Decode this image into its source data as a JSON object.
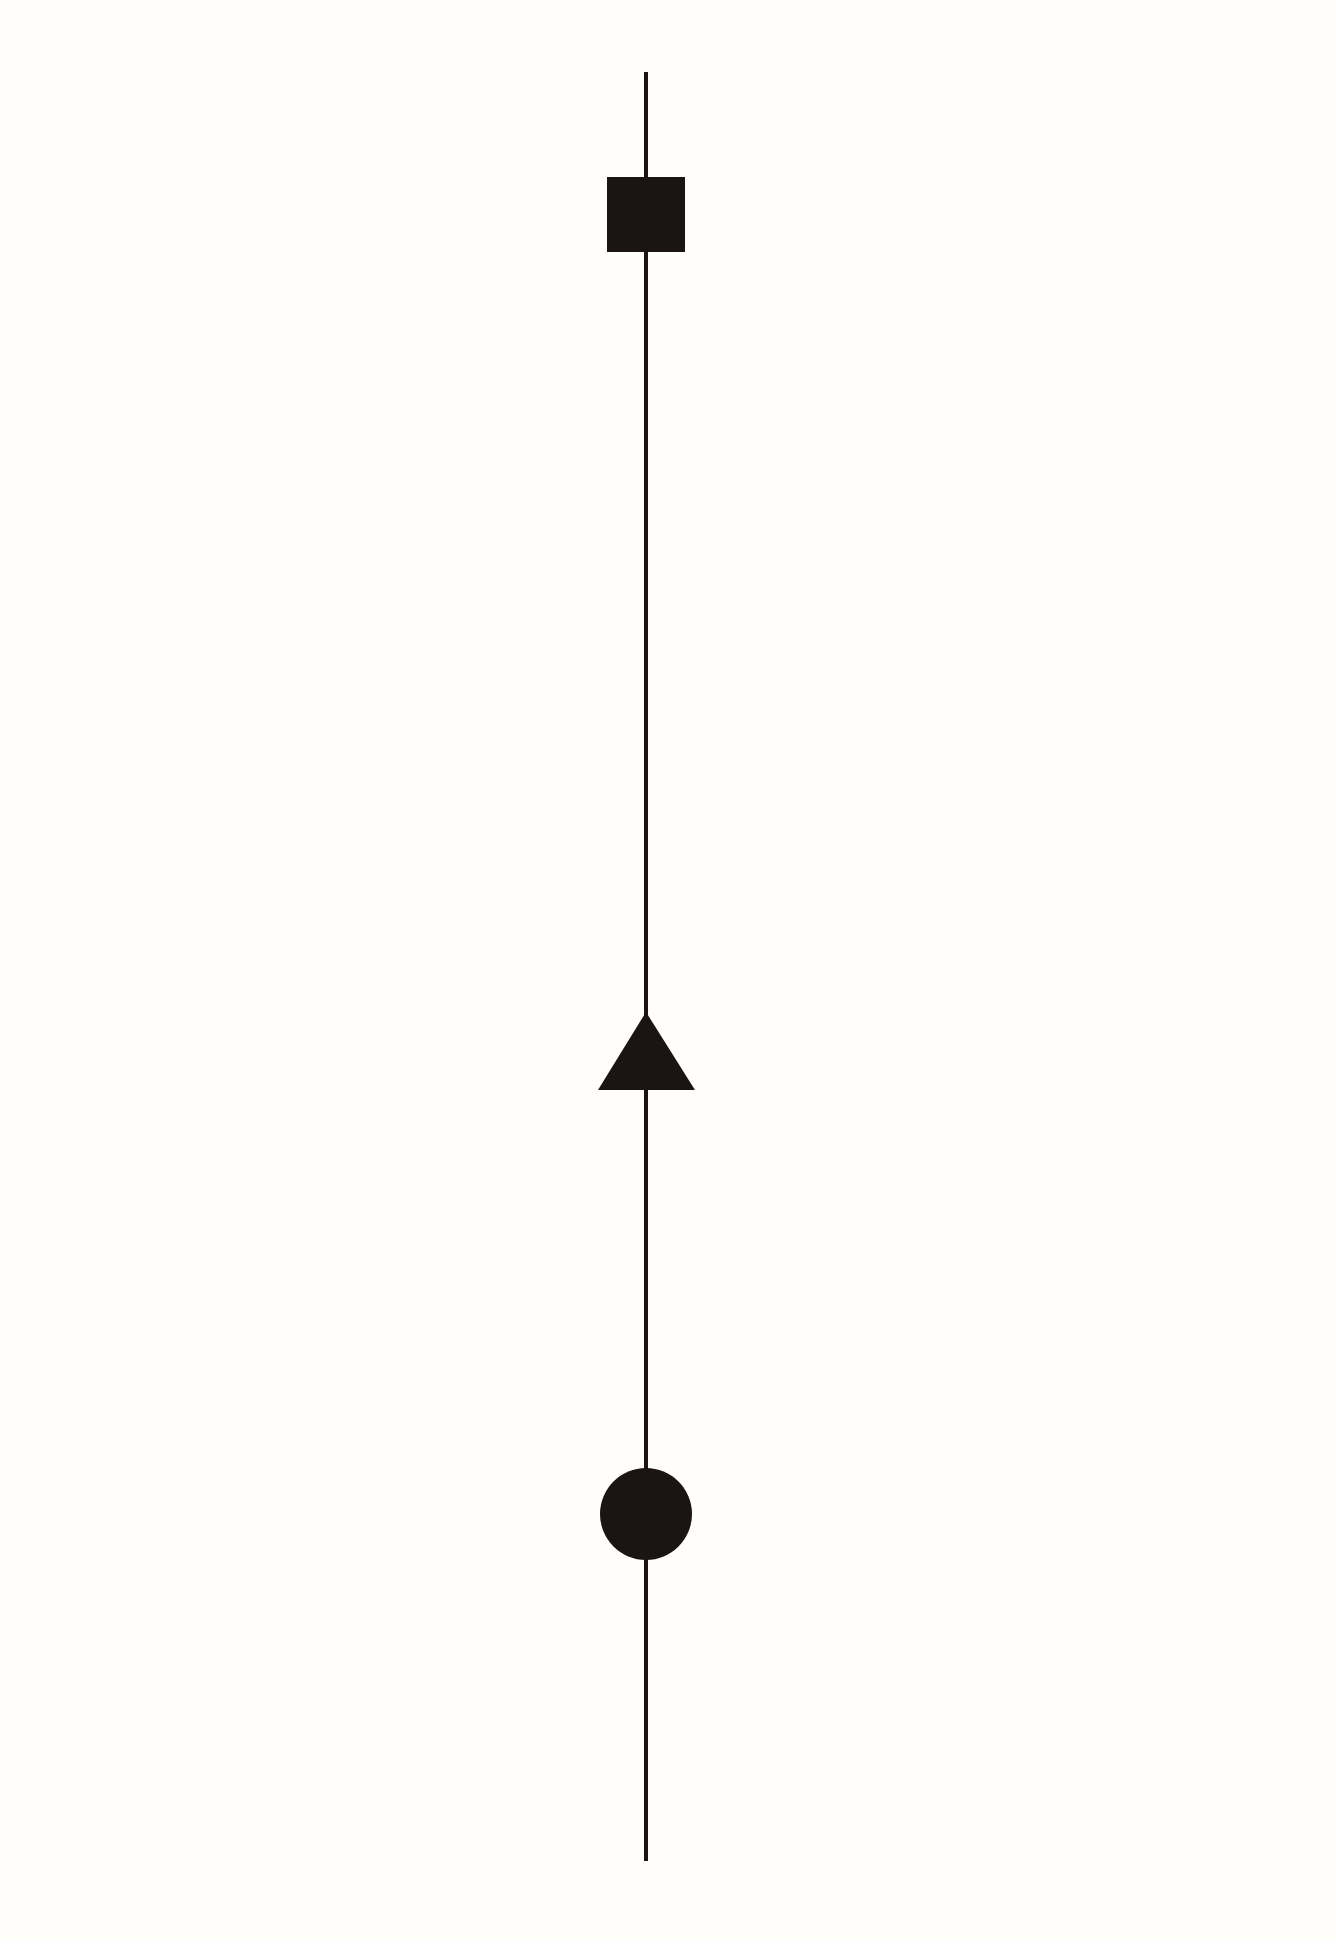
{
  "canvas": {
    "width": 1336,
    "height": 1940,
    "background": "#fffefa"
  },
  "colors": {
    "ink": "#1a1414"
  },
  "line": {
    "x": 646,
    "y_top": 72,
    "y_bottom": 1861,
    "stroke_width": 4
  },
  "shapes": [
    {
      "type": "square",
      "name": "square-shape",
      "x": 607,
      "y": 177,
      "width": 78,
      "height": 75
    },
    {
      "type": "triangle",
      "name": "triangle-shape",
      "apex_x": 646,
      "apex_y": 1012,
      "base_left_x": 598,
      "base_right_x": 695,
      "base_y": 1090
    },
    {
      "type": "circle",
      "name": "circle-shape",
      "cx": 646,
      "cy": 1514,
      "r": 46
    }
  ]
}
